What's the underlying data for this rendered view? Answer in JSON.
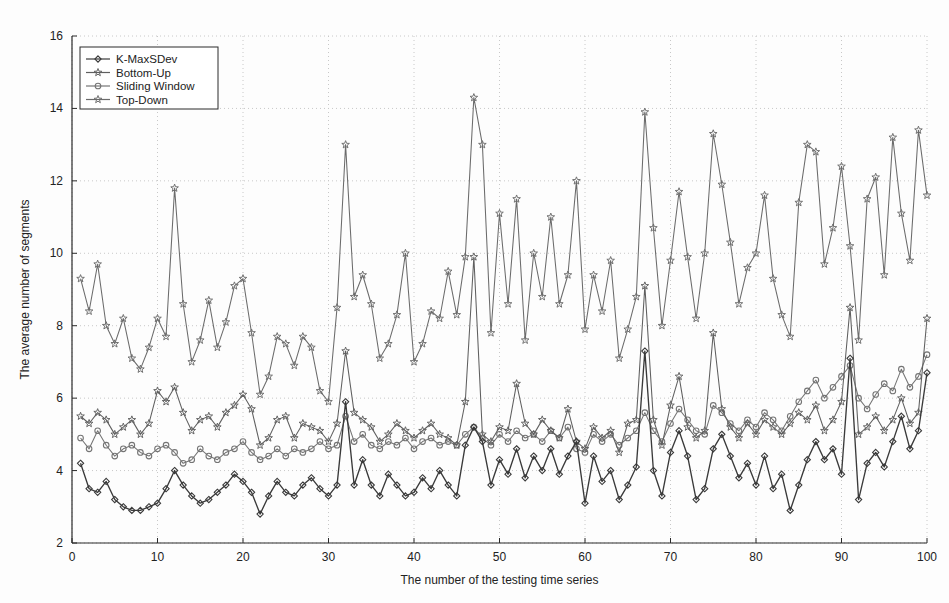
{
  "chart_data": {
    "type": "line",
    "title": "",
    "xlabel": "The number of the testing time series",
    "ylabel": "The average number of segments",
    "xlim": [
      0,
      100
    ],
    "ylim": [
      2,
      16
    ],
    "xticks": [
      0,
      10,
      20,
      30,
      40,
      50,
      60,
      70,
      80,
      90,
      100
    ],
    "yticks": [
      2,
      4,
      6,
      8,
      10,
      12,
      14,
      16
    ],
    "grid": true,
    "legend_position": "top-left",
    "x": [
      1,
      2,
      3,
      4,
      5,
      6,
      7,
      8,
      9,
      10,
      11,
      12,
      13,
      14,
      15,
      16,
      17,
      18,
      19,
      20,
      21,
      22,
      23,
      24,
      25,
      26,
      27,
      28,
      29,
      30,
      31,
      32,
      33,
      34,
      35,
      36,
      37,
      38,
      39,
      40,
      41,
      42,
      43,
      44,
      45,
      46,
      47,
      48,
      49,
      50,
      51,
      52,
      53,
      54,
      55,
      56,
      57,
      58,
      59,
      60,
      61,
      62,
      63,
      64,
      65,
      66,
      67,
      68,
      69,
      70,
      71,
      72,
      73,
      74,
      75,
      76,
      77,
      78,
      79,
      80,
      81,
      82,
      83,
      84,
      85,
      86,
      87,
      88,
      89,
      90,
      91,
      92,
      93,
      94,
      95,
      96,
      97,
      98,
      99,
      100
    ],
    "series": [
      {
        "name": "K-MaxSDev",
        "color": "#3a3a3a",
        "marker": "diamond",
        "values": [
          4.2,
          3.5,
          3.4,
          3.7,
          3.2,
          3.0,
          2.9,
          2.9,
          3.0,
          3.1,
          3.5,
          4.0,
          3.6,
          3.3,
          3.1,
          3.2,
          3.4,
          3.6,
          3.9,
          3.7,
          3.4,
          2.8,
          3.3,
          3.7,
          3.4,
          3.3,
          3.6,
          3.8,
          3.5,
          3.3,
          3.6,
          5.9,
          3.6,
          4.3,
          3.6,
          3.3,
          3.9,
          3.6,
          3.3,
          3.4,
          3.8,
          3.5,
          4.0,
          3.6,
          3.3,
          4.7,
          5.2,
          4.8,
          3.6,
          4.3,
          3.9,
          4.6,
          3.8,
          4.4,
          4.0,
          4.6,
          3.9,
          4.4,
          4.8,
          3.1,
          4.4,
          3.7,
          4.0,
          3.2,
          3.6,
          4.1,
          7.3,
          4.0,
          3.3,
          4.5,
          5.1,
          4.4,
          3.2,
          3.5,
          4.6,
          5.0,
          4.4,
          3.8,
          4.2,
          3.6,
          4.4,
          3.5,
          3.9,
          2.9,
          3.6,
          4.3,
          4.8,
          4.3,
          4.6,
          3.9,
          7.1,
          3.2,
          4.2,
          4.5,
          4.1,
          4.8,
          5.5,
          4.6,
          5.1,
          6.7
        ]
      },
      {
        "name": "Bottom-Up",
        "color": "#5f5f5f",
        "marker": "star",
        "values": [
          5.5,
          5.3,
          5.6,
          5.4,
          5.0,
          5.2,
          5.4,
          5.0,
          5.3,
          6.2,
          5.9,
          6.3,
          5.6,
          5.1,
          5.4,
          5.5,
          5.2,
          5.6,
          5.8,
          6.1,
          5.7,
          4.7,
          4.9,
          5.4,
          5.5,
          4.9,
          5.3,
          5.2,
          5.1,
          4.8,
          5.3,
          7.3,
          5.6,
          5.4,
          5.2,
          4.8,
          5.0,
          5.3,
          5.1,
          4.9,
          5.1,
          5.3,
          5.0,
          4.9,
          4.7,
          5.9,
          9.9,
          5.0,
          4.8,
          5.2,
          5.1,
          6.4,
          5.3,
          5.0,
          5.4,
          5.1,
          4.9,
          5.7,
          4.8,
          4.6,
          5.2,
          4.9,
          5.1,
          4.5,
          5.3,
          5.4,
          9.1,
          5.4,
          4.7,
          5.8,
          6.6,
          5.2,
          4.9,
          5.1,
          7.8,
          5.7,
          5.2,
          4.9,
          5.3,
          5.0,
          5.4,
          5.2,
          5.0,
          5.3,
          5.6,
          5.4,
          5.8,
          5.1,
          5.4,
          5.9,
          8.5,
          5.0,
          5.2,
          5.5,
          5.1,
          5.4,
          6.0,
          5.3,
          5.6,
          8.2
        ]
      },
      {
        "name": "Sliding Window",
        "color": "#747474",
        "marker": "circle",
        "values": [
          4.9,
          4.6,
          5.1,
          4.7,
          4.4,
          4.6,
          4.7,
          4.5,
          4.4,
          4.6,
          4.7,
          4.5,
          4.2,
          4.3,
          4.6,
          4.4,
          4.3,
          4.5,
          4.6,
          4.8,
          4.5,
          4.3,
          4.4,
          4.6,
          4.4,
          4.6,
          4.5,
          4.6,
          4.8,
          4.6,
          4.7,
          5.5,
          4.8,
          5.0,
          4.7,
          4.6,
          4.8,
          4.7,
          4.9,
          4.6,
          4.8,
          4.9,
          4.7,
          4.8,
          4.7,
          5.0,
          5.2,
          4.9,
          4.7,
          5.0,
          4.8,
          5.1,
          4.9,
          5.0,
          4.8,
          5.1,
          4.9,
          5.2,
          4.6,
          4.5,
          5.0,
          4.8,
          5.0,
          4.7,
          4.9,
          5.1,
          5.6,
          5.1,
          4.8,
          5.3,
          5.7,
          5.4,
          5.1,
          5.0,
          5.8,
          5.6,
          5.3,
          5.1,
          5.4,
          5.2,
          5.6,
          5.4,
          5.1,
          5.5,
          5.9,
          6.2,
          6.5,
          6.0,
          6.3,
          6.6,
          6.9,
          6.0,
          5.7,
          6.1,
          6.4,
          6.2,
          6.8,
          6.3,
          6.6,
          7.2
        ]
      },
      {
        "name": "Top-Down",
        "color": "#6b6b6b",
        "marker": "star5",
        "values": [
          9.3,
          8.4,
          9.7,
          8.0,
          7.5,
          8.2,
          7.1,
          6.8,
          7.4,
          8.2,
          7.7,
          11.8,
          8.6,
          7.0,
          7.6,
          8.7,
          7.4,
          8.1,
          9.1,
          9.3,
          7.8,
          6.1,
          6.6,
          7.7,
          7.5,
          6.9,
          7.7,
          7.4,
          6.2,
          5.9,
          8.5,
          13.0,
          8.8,
          9.4,
          8.6,
          7.1,
          7.5,
          8.3,
          10.0,
          7.0,
          7.5,
          8.4,
          8.2,
          9.5,
          8.3,
          9.9,
          14.3,
          13.0,
          7.8,
          11.1,
          8.6,
          11.5,
          7.6,
          10.0,
          8.8,
          11.0,
          8.6,
          9.4,
          12.0,
          7.9,
          9.4,
          8.4,
          9.8,
          7.1,
          7.9,
          8.8,
          13.9,
          10.7,
          8.0,
          9.8,
          11.7,
          9.9,
          8.2,
          10.0,
          13.3,
          11.9,
          10.3,
          8.6,
          9.6,
          10.0,
          11.6,
          9.3,
          8.3,
          7.7,
          11.4,
          13.0,
          12.8,
          9.7,
          10.7,
          12.4,
          10.2,
          7.6,
          11.5,
          12.1,
          9.4,
          13.2,
          11.1,
          9.8,
          13.4,
          11.6
        ]
      }
    ]
  },
  "legend": {
    "items": [
      {
        "label": "K-MaxSDev"
      },
      {
        "label": "Bottom-Up"
      },
      {
        "label": "Sliding Window"
      },
      {
        "label": "Top-Down"
      }
    ]
  },
  "axes": {
    "ylabel": "The average number of segments",
    "xlabel": "The number of the testing time series",
    "xtick_labels": [
      "0",
      "10",
      "20",
      "30",
      "40",
      "50",
      "60",
      "70",
      "80",
      "90",
      "100"
    ],
    "ytick_labels": [
      "2",
      "4",
      "6",
      "8",
      "10",
      "12",
      "14",
      "16"
    ]
  }
}
